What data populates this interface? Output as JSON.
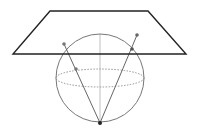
{
  "diagram": {
    "type": "stereographic-projection",
    "plane": {
      "points": "50,11 148,11 186,54 13,54",
      "stroke": "#222222",
      "stroke_width": 1.4
    },
    "sphere": {
      "cx": 100,
      "cy": 78,
      "r": 44,
      "stroke": "#777777"
    },
    "equator": {
      "cx": 100,
      "cy": 78,
      "rx": 44,
      "ry": 9,
      "stroke": "#888888"
    },
    "axis": {
      "x1": 100,
      "y1": 34,
      "x2": 100,
      "y2": 123,
      "stroke": "#cccccc"
    },
    "rays": [
      {
        "x1": 100,
        "y1": 123,
        "x2": 64,
        "y2": 44
      },
      {
        "x1": 100,
        "y1": 123,
        "x2": 137,
        "y2": 35
      }
    ],
    "points": [
      {
        "name": "projection-pole",
        "cx": 100,
        "cy": 123,
        "fill": "#222222"
      },
      {
        "name": "left-plane-point",
        "cx": 64,
        "cy": 44,
        "fill": "#777777"
      },
      {
        "name": "left-sphere-point",
        "cx": 76,
        "cy": 69,
        "fill": "#777777"
      },
      {
        "name": "right-plane-point",
        "cx": 137,
        "cy": 35,
        "fill": "#666666"
      },
      {
        "name": "right-sphere-point",
        "cx": 132,
        "cy": 49,
        "fill": "#555555"
      }
    ]
  }
}
